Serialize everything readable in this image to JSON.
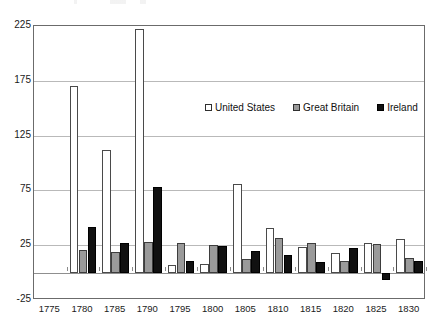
{
  "chart_data": {
    "type": "bar",
    "title": "",
    "subtitle": "",
    "xlabel": "",
    "ylabel": "",
    "categories": [
      "1775",
      "1780",
      "1785",
      "1790",
      "1795",
      "1800",
      "1805",
      "1810",
      "1815",
      "1820",
      "1825",
      "1830"
    ],
    "series": [
      {
        "name": "United States",
        "color": "#ffffff",
        "values": [
          null,
          170,
          112,
          222,
          7,
          8,
          81,
          41,
          23,
          18,
          27,
          31
        ]
      },
      {
        "name": "Great Britain",
        "color": "#9a9a9a",
        "values": [
          null,
          21,
          19,
          28,
          27,
          25,
          12,
          32,
          27,
          11,
          26,
          13
        ]
      },
      {
        "name": "Ireland",
        "color": "#111111",
        "values": [
          null,
          42,
          27,
          78,
          11,
          24,
          20,
          16,
          10,
          22,
          -7,
          11
        ]
      }
    ],
    "ylim": [
      -25,
      225
    ],
    "yticks": [
      225,
      175,
      125,
      75,
      25,
      -25
    ],
    "ytick_labels": [
      "225",
      "175",
      "125",
      "75",
      "25",
      "-25"
    ],
    "xtick_labels": [
      "1775",
      "1780",
      "1785",
      "1790",
      "1795",
      "1800",
      "1805",
      "1810",
      "1815",
      "1820",
      "1825",
      "1830"
    ],
    "grid": true,
    "grid_axis": "y",
    "legend_position": "inside-upper-center",
    "legend_entries": [
      "United States",
      "Great Britain",
      "Ireland"
    ],
    "annotations": []
  },
  "legend": {
    "items": [
      {
        "label": "United States",
        "swatch": "swatch-open-square-icon"
      },
      {
        "label": "Great Britain",
        "swatch": "swatch-gray-square-icon"
      },
      {
        "label": "Ireland",
        "swatch": "swatch-black-square-icon"
      }
    ]
  }
}
